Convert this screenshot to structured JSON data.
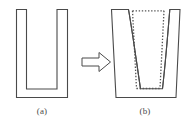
{
  "figure": {
    "type": "technical-diagram",
    "background_color": "#ffffff",
    "line_color": "#4a4a4a",
    "dotted_line_color": "#555555",
    "caption_color": "#4a4a4a",
    "panels": [
      {
        "id": "a",
        "label": "(a)",
        "name": "initial-trench-profile",
        "shape": "U-shaped trench with straight vertical sidewalls",
        "outline_points": "16,9 26,9 26,89 57,89 57,9 68,9 68,98 16,98",
        "outer_box": {
          "left": 16,
          "top": 9,
          "right": 68,
          "bottom": 98
        },
        "trench_opening": {
          "left": 26,
          "right": 57,
          "top": 9,
          "bottom": 89
        }
      },
      {
        "id": "arrow",
        "label": "",
        "name": "transformation-arrow",
        "shape": "hollow right-pointing block arrow",
        "outline_points": "82,58 99,58 99,53 110,62 99,71 99,66 82,66",
        "direction": "right"
      },
      {
        "id": "b",
        "label": "(b)",
        "name": "eroded-trench-profile",
        "shape": "Widened trench with outward-tapered curved sidewalls; dotted lines show original profile",
        "outer_box": {
          "left": 111,
          "top": 9,
          "right": 180,
          "bottom": 98
        },
        "trench_bottom": {
          "left": 134,
          "right": 162,
          "bottom": 89
        },
        "solid_outline_points": "111,9 128,9 142,89 162,89 170,9 180,9 175,98 117,98",
        "dotted_outline_points": "132,11 136,89 160,89 164,11",
        "dotted_top_span": {
          "from_x": 132,
          "to_x": 164,
          "y": 11
        },
        "dotted_style": "dotted"
      }
    ],
    "captions": {
      "a": "(a)",
      "b": "(b)"
    }
  }
}
